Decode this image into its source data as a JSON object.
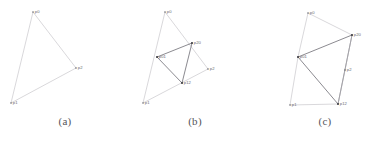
{
  "figure": {
    "background": "#ffffff",
    "line_color_light": "#b9b8bd",
    "line_color_dark": "#6d6c73",
    "label_color": "#6b6a70",
    "caption_color": "#55545a"
  },
  "panels": [
    {
      "id": "a",
      "caption": "(a)",
      "vertices": [
        {
          "name": "p0",
          "label": "p0",
          "x": 33,
          "y": 12,
          "marker": "dot"
        },
        {
          "name": "p1",
          "label": "p1",
          "x": 11,
          "y": 103,
          "marker": "dot"
        },
        {
          "name": "p2",
          "label": "p2",
          "x": 76,
          "y": 68,
          "marker": "dot"
        }
      ],
      "edges": [
        {
          "from": "p0",
          "to": "p1",
          "style": "light"
        },
        {
          "from": "p0",
          "to": "p2",
          "style": "light"
        },
        {
          "from": "p1",
          "to": "p2",
          "style": "light"
        }
      ]
    },
    {
      "id": "b",
      "caption": "(b)",
      "vertices": [
        {
          "name": "p0",
          "label": "p0",
          "x": 35,
          "y": 12,
          "marker": "dot"
        },
        {
          "name": "p1",
          "label": "p1",
          "x": 13,
          "y": 103,
          "marker": "dot"
        },
        {
          "name": "p2",
          "label": "p2",
          "x": 78,
          "y": 69,
          "marker": "dot"
        },
        {
          "name": "p01",
          "label": "p01",
          "x": 27,
          "y": 57,
          "marker": "square"
        },
        {
          "name": "p20",
          "label": "p20",
          "x": 62,
          "y": 43,
          "marker": "square"
        },
        {
          "name": "p12",
          "label": "p12",
          "x": 52,
          "y": 83,
          "marker": "square"
        }
      ],
      "edges": [
        {
          "from": "p0",
          "to": "p1",
          "style": "light"
        },
        {
          "from": "p0",
          "to": "p2",
          "style": "light"
        },
        {
          "from": "p1",
          "to": "p2",
          "style": "light"
        },
        {
          "from": "p01",
          "to": "p20",
          "style": "dark"
        },
        {
          "from": "p20",
          "to": "p12",
          "style": "dark"
        },
        {
          "from": "p12",
          "to": "p01",
          "style": "dark"
        }
      ]
    },
    {
      "id": "c",
      "caption": "(c)",
      "vertices": [
        {
          "name": "p0",
          "label": "p0",
          "x": 48,
          "y": 13,
          "marker": "dot"
        },
        {
          "name": "p1",
          "label": "p1",
          "x": 30,
          "y": 105,
          "marker": "dot"
        },
        {
          "name": "p2",
          "label": "p2",
          "x": 85,
          "y": 70,
          "marker": "dot"
        },
        {
          "name": "p01",
          "label": "p01",
          "x": 38,
          "y": 57,
          "marker": "square"
        },
        {
          "name": "p20",
          "label": "p20",
          "x": 92,
          "y": 35,
          "marker": "square"
        },
        {
          "name": "p12",
          "label": "p12",
          "x": 78,
          "y": 104,
          "marker": "square"
        }
      ],
      "edges": [
        {
          "from": "p0",
          "to": "p01",
          "style": "light"
        },
        {
          "from": "p0",
          "to": "p20",
          "style": "light"
        },
        {
          "from": "p01",
          "to": "p20",
          "style": "dark"
        },
        {
          "from": "p01",
          "to": "p12",
          "style": "dark"
        },
        {
          "from": "p20",
          "to": "p12",
          "style": "dark"
        },
        {
          "from": "p01",
          "to": "p1",
          "style": "light"
        },
        {
          "from": "p1",
          "to": "p12",
          "style": "light"
        },
        {
          "from": "p20",
          "to": "p2",
          "style": "light"
        },
        {
          "from": "p2",
          "to": "p12",
          "style": "light"
        }
      ]
    }
  ]
}
